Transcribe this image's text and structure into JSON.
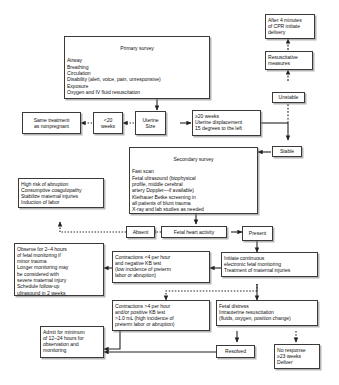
{
  "diagram": {
    "type": "flowchart",
    "nodes": {
      "primary_survey": {
        "header": "Primary survey",
        "body": "Airway\nBreathing\nCirculation\nDisability (alert, voice, pain, unresponsive)\nExposure\n    Oxygen and IV fluid resuscitation"
      },
      "cpr_delivery": {
        "text": "After 4 minutes\nof CPR initiate\ndelivery"
      },
      "resuscitative": {
        "text": "Resuscitative\nmeasures"
      },
      "unstable": {
        "text": "Unstable"
      },
      "stable": {
        "text": "Stable"
      },
      "same_treatment": {
        "text": "Same treatment\nas nonpregnant"
      },
      "under_20_weeks": {
        "text": "<20\nweeks"
      },
      "uterine_size": {
        "text": "Uterine\nSize"
      },
      "over_20_weeks": {
        "text": "≥20 weeks\nUterine displacement\n15 degrees to the left"
      },
      "secondary_survey": {
        "header": "Secondary survey",
        "body": "Fast scan\nFetal ultrasound (biophysical\n    profile, middle cerebral\n    artery Doppler—if available)\nKleihauer Betke screening in\n    all patients of blunt trauma\nX-ray and lab studies as needed"
      },
      "high_risk_abruption": {
        "text": "High risk of abruption\nConsumptive coagulopathy\nStabilize maternal injuries\nInduction of labor"
      },
      "absent": {
        "text": "Absent"
      },
      "fetal_heart_activity": {
        "text": "Fetal heart activity"
      },
      "present": {
        "text": "Present"
      },
      "observe_2_4_hours": {
        "text": "Observe for 2–4 hours\n    of fetal monitoring if\n    minor trauma\nLonger monitoring may\n    be considered with\n    severe maternal injury\nSchedule follow-up\n    ultrasound in 2 weeks"
      },
      "contractions_under_4": {
        "text": "Contractions <4 per hour\nand negative KB test\n(low incidence of preterm\nlabor or abruption)"
      },
      "initiate_monitoring": {
        "text": "Initiate continuous\nelectronic fetal monitoring\nTreatment of maternal injuries"
      },
      "contractions_over_4": {
        "text": "Contractions >4 per hour\nand/or positive KB test\n>1.0 mL (high incidence of\npreterm labor or abruption)"
      },
      "fetal_distress": {
        "text": "Fetal distress\nIntrauterine resuscitation\n(fluids, oxygen, position change)"
      },
      "resolved": {
        "text": "Resolved"
      },
      "no_response": {
        "text": "No response\n≥23 weeks\nDeliver"
      },
      "admit_minimum": {
        "text": "Admit for minimum\nof 12–24 hours for\nobservation and\nmonitoring"
      }
    },
    "colors": {
      "border": "#3a3a3a",
      "shadow": "#787878",
      "background": "#ffffff",
      "text": "#111111",
      "edge": "#222222"
    }
  }
}
